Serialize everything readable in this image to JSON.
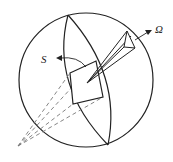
{
  "diagram": {
    "type": "solid-angle-illustration",
    "labels": {
      "surface": "S",
      "solid_angle": "Ω"
    },
    "colors": {
      "stroke": "#222222",
      "dashed": "#777777",
      "background": "#ffffff"
    }
  }
}
